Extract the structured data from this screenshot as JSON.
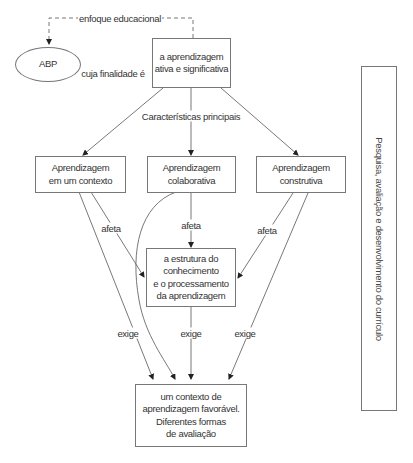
{
  "diagram": {
    "nodes": {
      "abp": {
        "label": "ABP"
      },
      "goal": {
        "label": "a aprendizagem\nativa e significativa"
      },
      "context": {
        "label": "Aprendizagem\nem um contexto"
      },
      "collaborative": {
        "label": "Aprendizagem\ncolaborativa"
      },
      "constructive": {
        "label": "Aprendizagem\nconstrutiva"
      },
      "knowledge": {
        "label": "a estrutura do\nconhecimento\ne o processamento\nda aprendizagem"
      },
      "environment": {
        "label": "um contexto de\naprendizagem favorável.\nDiferentes formas\nde avaliação"
      }
    },
    "side_panel": {
      "label": "Pesquisa, avaliação e desenvolvimento do currículo"
    },
    "edge_labels": {
      "educational_focus": "enfoque educacional",
      "whose_goal": "cuja finalidade é",
      "main_characteristics": "Características principais",
      "affects_context": "afeta",
      "affects_collaborative": "afeta",
      "affects_constructive": "afeta",
      "requires_context": "exige",
      "requires_knowledge": "exige",
      "requires_constructive": "exige"
    },
    "colors": {
      "line": "#555555",
      "box_border": "#777777",
      "text": "#333333"
    }
  }
}
